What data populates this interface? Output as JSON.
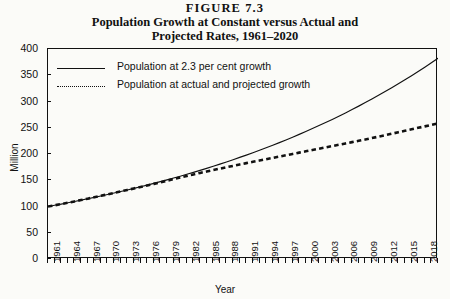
{
  "figure": {
    "number_line": "FIGURE 7.3",
    "title_line_1": "Population Growth at Constant versus Actual and",
    "title_line_2": "Projected Rates, 1961–2020"
  },
  "axes": {
    "y_title": "Million",
    "x_title": "Year"
  },
  "legend": {
    "position": "upper-left-inside",
    "items": [
      {
        "label": "Population at 2.3 per cent growth",
        "style": "solid"
      },
      {
        "label": "Population at actual and projected growth",
        "style": "dotted"
      }
    ]
  },
  "chart_data": {
    "type": "line",
    "title": "Population Growth at Constant versus Actual and Projected Rates, 1961–2020",
    "subtitle": "FIGURE 7.3",
    "xlabel": "Year",
    "ylabel": "Million",
    "xlim": [
      1961,
      2020
    ],
    "ylim": [
      0,
      400
    ],
    "grid": false,
    "y_ticks": [
      0,
      50,
      100,
      150,
      200,
      250,
      300,
      350,
      400
    ],
    "x_ticks": [
      1961,
      1964,
      1967,
      1970,
      1973,
      1976,
      1979,
      1982,
      1985,
      1988,
      1991,
      1994,
      1997,
      2000,
      2003,
      2006,
      2009,
      2012,
      2015,
      2018
    ],
    "x_tick_interval_years": 3,
    "x_minor_tick_interval_years": 1,
    "x": [
      1961,
      1962,
      1963,
      1964,
      1965,
      1966,
      1967,
      1968,
      1969,
      1970,
      1971,
      1972,
      1973,
      1974,
      1975,
      1976,
      1977,
      1978,
      1979,
      1980,
      1981,
      1982,
      1983,
      1984,
      1985,
      1986,
      1987,
      1988,
      1989,
      1990,
      1991,
      1992,
      1993,
      1994,
      1995,
      1996,
      1997,
      1998,
      1999,
      2000,
      2001,
      2002,
      2003,
      2004,
      2005,
      2006,
      2007,
      2008,
      2009,
      2010,
      2011,
      2012,
      2013,
      2014,
      2015,
      2016,
      2017,
      2018,
      2019,
      2020
    ],
    "series": [
      {
        "name": "Population at 2.3 per cent growth",
        "style": "solid",
        "color": "#111111",
        "values": [
          100.0,
          102.3,
          104.6,
          107.1,
          109.6,
          112.1,
          114.7,
          117.3,
          120.0,
          122.8,
          125.6,
          128.5,
          131.5,
          134.5,
          137.6,
          140.8,
          144.0,
          147.3,
          150.7,
          154.2,
          157.7,
          161.3,
          165.0,
          168.8,
          172.7,
          176.7,
          180.7,
          184.9,
          189.1,
          193.5,
          197.9,
          202.5,
          207.1,
          211.9,
          216.8,
          221.7,
          226.8,
          232.0,
          237.4,
          242.8,
          248.4,
          254.1,
          260.0,
          265.9,
          272.0,
          278.3,
          284.7,
          291.2,
          297.9,
          304.7,
          311.7,
          318.9,
          326.2,
          333.7,
          341.3,
          349.2,
          357.2,
          365.4,
          373.8,
          382.4
        ]
      },
      {
        "name": "Population at actual and projected growth",
        "style": "dotted",
        "color": "#111111",
        "values": [
          100.0,
          102.3,
          104.7,
          107.2,
          109.7,
          112.3,
          114.9,
          117.6,
          120.3,
          123.1,
          125.9,
          128.7,
          131.5,
          134.4,
          137.3,
          140.2,
          143.1,
          146.1,
          149.1,
          152.1,
          155.1,
          158.1,
          161.0,
          163.9,
          166.7,
          169.4,
          172.1,
          174.8,
          177.4,
          180.0,
          182.6,
          185.1,
          187.6,
          190.1,
          192.6,
          195.1,
          197.6,
          200.1,
          202.6,
          205.1,
          207.6,
          210.1,
          212.6,
          215.1,
          217.6,
          220.1,
          222.6,
          225.1,
          227.6,
          230.3,
          233.0,
          235.8,
          238.6,
          241.4,
          244.2,
          247.0,
          249.8,
          252.6,
          255.4,
          258.2
        ]
      }
    ],
    "annotations": [
      "Both series begin at approximately 100 million in 1961.",
      "Series are nearly coincident until about 1985, then diverge.",
      "Constant 2.3 per cent growth reaches about 375 million by 2020.",
      "Actual and projected growth reaches about 270 million by 2020."
    ]
  }
}
